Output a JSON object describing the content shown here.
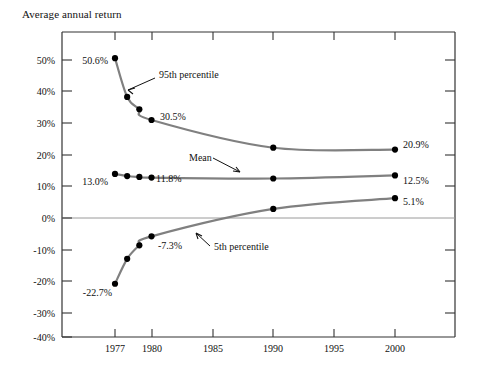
{
  "chart_data": {
    "type": "line",
    "title": "Average annual return",
    "xlabel": "",
    "ylabel": "",
    "xlim": [
      1975.5,
      2002.5
    ],
    "ylim": [
      -40,
      50
    ],
    "grid": false,
    "zero_line": true,
    "legend_position": "inline-annotations",
    "x_ticks": [
      1977,
      1980,
      1985,
      1990,
      1995,
      2000
    ],
    "x_tick_labels": [
      "1977",
      "1980",
      "1985",
      "1990",
      "1995",
      "2000"
    ],
    "y_ticks": [
      50,
      40,
      30,
      20,
      10,
      0,
      -10,
      -20,
      -30,
      -40
    ],
    "y_tick_labels": [
      "50%",
      "40%",
      "30%",
      "20%",
      "10%",
      "0%",
      "-10%",
      "-20%",
      "-30%",
      "-40%"
    ],
    "series": [
      {
        "name": "95th percentile",
        "color": "#808080",
        "x": [
          1977,
          1978,
          1979,
          1980,
          1990,
          2000
        ],
        "values": [
          50.6,
          38.0,
          34.0,
          30.5,
          21.5,
          20.9
        ]
      },
      {
        "name": "Mean",
        "color": "#808080",
        "x": [
          1977,
          1978,
          1979,
          1980,
          1990,
          2000
        ],
        "values": [
          13.0,
          12.3,
          12.0,
          11.8,
          11.5,
          12.5
        ]
      },
      {
        "name": "5th percentile",
        "color": "#808080",
        "x": [
          1977,
          1978,
          1979,
          1980,
          1990,
          2000
        ],
        "values": [
          -22.7,
          -14.6,
          -10.2,
          -7.3,
          1.6,
          5.1
        ]
      }
    ],
    "annotations": [
      {
        "text": "95th percentile",
        "series": "95th percentile",
        "x": 159,
        "y": 74,
        "arrow": true
      },
      {
        "text": "Mean",
        "series": "Mean",
        "x": 189,
        "y": 163,
        "arrow": true
      },
      {
        "text": "5th percentile",
        "series": "5th percentile",
        "x": 214,
        "y": 249,
        "arrow": true
      }
    ],
    "data_labels": [
      {
        "text": "50.6%",
        "series": "95th percentile",
        "point": 1977
      },
      {
        "text": "30.5%",
        "series": "95th percentile",
        "point": 1980
      },
      {
        "text": "20.9%",
        "series": "95th percentile",
        "point": 2000
      },
      {
        "text": "13.0%",
        "series": "Mean",
        "point": 1977
      },
      {
        "text": "11.8%",
        "series": "Mean",
        "point": 1980
      },
      {
        "text": "12.5%",
        "series": "Mean",
        "point": 2000
      },
      {
        "text": "-22.7%",
        "series": "5th percentile",
        "point": 1977
      },
      {
        "text": "-7.3%",
        "series": "5th percentile",
        "point": 1980
      },
      {
        "text": "5.1%",
        "series": "5th percentile",
        "point": 2000
      }
    ]
  }
}
